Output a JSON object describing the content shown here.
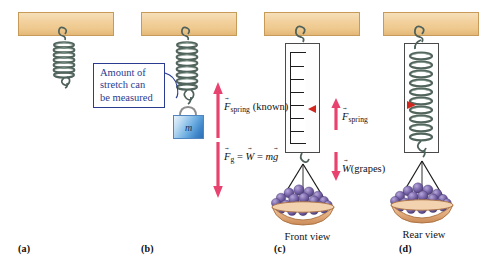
{
  "figure": {
    "background": "#ffffff"
  },
  "colors": {
    "ceiling_fill": "#eec98f",
    "ceiling_stroke": "#c79a5a",
    "spring_metal": "#5c6f66",
    "callout_border": "#2a3c8f",
    "callout_text": "#2a3c8f",
    "force_arrow": "#e8436f",
    "marker_red": "#d1271f",
    "mass_block": "#3d84c8",
    "grape_purple": "#6f5ba0",
    "basket_tan": "#e0a878",
    "cord_black": "#1a1a1a"
  },
  "callout": {
    "text": "Amount of\nstretch can\nbe measured"
  },
  "panels": [
    {
      "id": "a",
      "label": "(a)",
      "caption": "",
      "description": "relaxed-hanging-spring"
    },
    {
      "id": "b",
      "label": "(b)",
      "caption": "",
      "description": "stretched-spring-with-mass",
      "mass_label": "m"
    },
    {
      "id": "c",
      "label": "(c)",
      "caption": "Front view",
      "description": "spring-scale-front-with-grapes"
    },
    {
      "id": "d",
      "label": "(d)",
      "caption": "Rear view",
      "description": "spring-scale-rear-with-grapes"
    }
  ],
  "force_labels": {
    "spring_known": {
      "symbol": "F",
      "subscript": "spring",
      "suffix": " (known)",
      "direction": "up"
    },
    "gravity": {
      "symbol": "F",
      "subscript": "g",
      "equals_1": " = ",
      "weight_symbol": "W",
      "equals_2": " = ",
      "mass_symbol": "m",
      "accel_symbol": "g",
      "direction": "down"
    },
    "spring_c": {
      "symbol": "F",
      "subscript": "spring",
      "direction": "up"
    },
    "weight_grapes": {
      "symbol": "W",
      "suffix": "(grapes)",
      "direction": "down"
    }
  },
  "scale": {
    "tick_count": 7,
    "marker_color": "#d1271f"
  }
}
